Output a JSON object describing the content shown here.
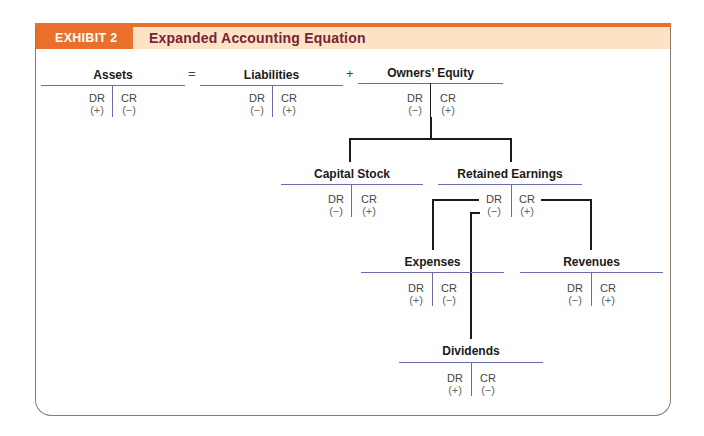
{
  "header": {
    "exhibit_label": "EXHIBIT 2",
    "title": "Expanded Accounting Equation"
  },
  "colors": {
    "accent": "#e8702a",
    "header_bg": "#fbe3c3",
    "title_text": "#7a1f3a",
    "t_line": "#6b6ba8"
  },
  "operators": {
    "equals": "=",
    "plus": "+"
  },
  "accounts": [
    {
      "name": "Assets",
      "dr": "DR",
      "cr": "CR",
      "dr_sign": "(+)",
      "cr_sign": "(−)"
    },
    {
      "name": "Liabilities",
      "dr": "DR",
      "cr": "CR",
      "dr_sign": "(−)",
      "cr_sign": "(+)"
    },
    {
      "name": "Owners’ Equity",
      "dr": "DR",
      "cr": "CR",
      "dr_sign": "(−)",
      "cr_sign": "(+)"
    },
    {
      "name": "Capital Stock",
      "dr": "DR",
      "cr": "CR",
      "dr_sign": "(−)",
      "cr_sign": "(+)"
    },
    {
      "name": "Retained Earnings",
      "dr": "DR",
      "cr": "CR",
      "dr_sign": "(−)",
      "cr_sign": "(+)"
    },
    {
      "name": "Expenses",
      "dr": "DR",
      "cr": "CR",
      "dr_sign": "(+)",
      "cr_sign": "(−)"
    },
    {
      "name": "Revenues",
      "dr": "DR",
      "cr": "CR",
      "dr_sign": "(−)",
      "cr_sign": "(+)"
    },
    {
      "name": "Dividends",
      "dr": "DR",
      "cr": "CR",
      "dr_sign": "(+)",
      "cr_sign": "(−)"
    }
  ]
}
